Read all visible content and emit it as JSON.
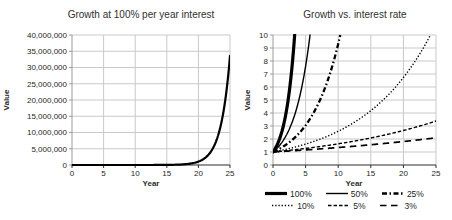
{
  "page": {
    "background": "#ffffff"
  },
  "colors": {
    "series_stroke": "#000000",
    "gridline": "#c9c9c9",
    "x_axis": "#2f2f2f",
    "y_axis": "#9b9b9b",
    "text": "#262626"
  },
  "chart_data": [
    {
      "type": "line",
      "title": "Growth at 100% per year interest",
      "xlabel": "Year",
      "ylabel": "Value",
      "xlim": [
        0,
        25
      ],
      "ylim": [
        0,
        40000000
      ],
      "grid": true,
      "legend": false,
      "x_ticks": [
        {
          "v": 0,
          "label": "0"
        },
        {
          "v": 5,
          "label": "5"
        },
        {
          "v": 10,
          "label": "10"
        },
        {
          "v": 15,
          "label": "15"
        },
        {
          "v": 20,
          "label": "20"
        },
        {
          "v": 25,
          "label": "25"
        }
      ],
      "y_ticks": [
        {
          "v": 0,
          "label": "0"
        },
        {
          "v": 5000000,
          "label": "5,000,000"
        },
        {
          "v": 10000000,
          "label": "10,000,000"
        },
        {
          "v": 15000000,
          "label": "15,000,000"
        },
        {
          "v": 20000000,
          "label": "20,000,000"
        },
        {
          "v": 25000000,
          "label": "25,000,000"
        },
        {
          "v": 30000000,
          "label": "30,000,000"
        },
        {
          "v": 35000000,
          "label": "35,000,000"
        },
        {
          "v": 40000000,
          "label": "40,000,000"
        }
      ],
      "series": [
        {
          "name": "100%",
          "line_style": "solid-medium",
          "x_start": 0,
          "x_step": 1,
          "values": [
            1,
            2,
            4,
            8,
            16,
            32,
            64,
            128,
            256,
            512,
            1024,
            2048,
            4096,
            8192,
            16384,
            32768,
            65536,
            131072,
            262144,
            524288,
            1048576,
            2097152,
            4194304,
            8388608,
            16777216,
            33554432
          ]
        }
      ]
    },
    {
      "type": "line",
      "title": "Growth vs. interest rate",
      "xlabel": "Year",
      "ylabel": "Value",
      "xlim": [
        0,
        25
      ],
      "ylim": [
        0,
        10
      ],
      "grid": true,
      "legend": true,
      "x_ticks": [
        {
          "v": 0,
          "label": "0"
        },
        {
          "v": 5,
          "label": "5"
        },
        {
          "v": 10,
          "label": "10"
        },
        {
          "v": 15,
          "label": "15"
        },
        {
          "v": 20,
          "label": "20"
        },
        {
          "v": 25,
          "label": "25"
        }
      ],
      "y_ticks": [
        {
          "v": 0,
          "label": "0"
        },
        {
          "v": 1,
          "label": "1"
        },
        {
          "v": 2,
          "label": "2"
        },
        {
          "v": 3,
          "label": "3"
        },
        {
          "v": 4,
          "label": "4"
        },
        {
          "v": 5,
          "label": "5"
        },
        {
          "v": 6,
          "label": "6"
        },
        {
          "v": 7,
          "label": "7"
        },
        {
          "v": 8,
          "label": "8"
        },
        {
          "v": 9,
          "label": "9"
        },
        {
          "v": 10,
          "label": "10"
        }
      ],
      "series": [
        {
          "name": "100%",
          "line_style": "solid-thick",
          "x_start": 0,
          "x_step": 1,
          "values": [
            1,
            2,
            4,
            8,
            16
          ]
        },
        {
          "name": "50%",
          "line_style": "solid-thin",
          "x_start": 0,
          "x_step": 1,
          "values": [
            1,
            1.5,
            2.25,
            3.375,
            5.0625,
            7.5938,
            11.3906
          ]
        },
        {
          "name": "25%",
          "line_style": "dash-dot-thick",
          "x_start": 0,
          "x_step": 1,
          "values": [
            1,
            1.25,
            1.5625,
            1.9531,
            2.4414,
            3.0518,
            3.8147,
            4.7684,
            5.9605,
            7.4506,
            9.3132,
            11.6415
          ]
        },
        {
          "name": "10%",
          "line_style": "dotted",
          "x_start": 0,
          "x_step": 1,
          "values": [
            1,
            1.1,
            1.21,
            1.331,
            1.4641,
            1.6105,
            1.7716,
            1.9487,
            2.1436,
            2.3579,
            2.5937,
            2.8531,
            3.1384,
            3.4523,
            3.7975,
            4.1772,
            4.595,
            5.0545,
            5.5599,
            6.1159,
            6.7275,
            7.4002,
            8.1403,
            8.9543,
            9.8497,
            10.8347
          ]
        },
        {
          "name": "5%",
          "line_style": "short-dash",
          "x_start": 0,
          "x_step": 1,
          "values": [
            1,
            1.05,
            1.1025,
            1.1576,
            1.2155,
            1.2763,
            1.3401,
            1.4071,
            1.4775,
            1.5513,
            1.6289,
            1.7103,
            1.7959,
            1.8856,
            1.9799,
            2.0789,
            2.1829,
            2.292,
            2.4066,
            2.527,
            2.6533,
            2.786,
            2.9253,
            3.0715,
            3.2251,
            3.3864
          ]
        },
        {
          "name": "3%",
          "line_style": "long-dash",
          "x_start": 0,
          "x_step": 1,
          "values": [
            1,
            1.03,
            1.0609,
            1.0927,
            1.1255,
            1.1593,
            1.1941,
            1.2299,
            1.2668,
            1.3048,
            1.3439,
            1.3842,
            1.4258,
            1.4685,
            1.5126,
            1.558,
            1.6047,
            1.6528,
            1.7024,
            1.7535,
            1.8061,
            1.8603,
            1.9161,
            1.9736,
            2.0328,
            2.0938
          ]
        }
      ]
    }
  ]
}
